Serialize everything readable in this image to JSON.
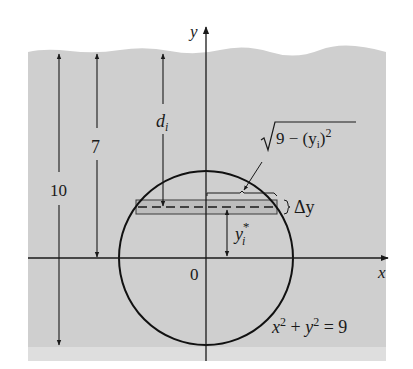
{
  "figure": {
    "colors": {
      "background": "#ffffff",
      "water": "#cfcfcf",
      "water_bottom_band": "#dedede",
      "strip_fill": "#bdbdbd",
      "ink": "#1a1a1a"
    },
    "axes": {
      "x_label": "x",
      "y_label": "y",
      "origin_label": "0"
    },
    "circle": {
      "equation_lhs_x": "x",
      "equation_exp": "2",
      "equation_plus": " + ",
      "equation_lhs_y": "y",
      "equation_rhs": " = 9",
      "radius": 3
    },
    "dimensions": {
      "depth_total_label": "10",
      "depth_center_label": "7",
      "depth_strip_label_main": "d",
      "depth_strip_label_sub": "i"
    },
    "strip": {
      "thickness_label": "Δy",
      "height_label_main": "y",
      "height_label_sub": "i",
      "height_label_sup": "*",
      "half_width_label_sqrt_body": "9 − (y",
      "half_width_label_sub": "i",
      "half_width_label_close": ")",
      "half_width_label_exp": "2"
    }
  }
}
